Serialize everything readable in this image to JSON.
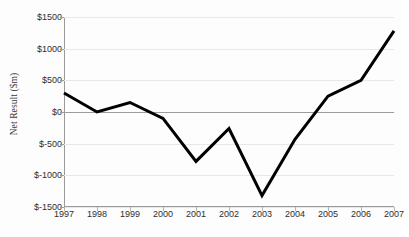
{
  "chart_data": {
    "type": "line",
    "title": "",
    "subtitle": "",
    "xlabel": "",
    "ylabel": "Net Result ($m)",
    "categories": [
      "1997",
      "1998",
      "1999",
      "2000",
      "2001",
      "2002",
      "2003",
      "2004",
      "2005",
      "2006",
      "2007"
    ],
    "values": [
      300,
      0,
      150,
      -100,
      -780,
      -260,
      -1320,
      -430,
      250,
      500,
      1280
    ],
    "series": [
      {
        "name": "Net Result",
        "values": [
          300,
          0,
          150,
          -100,
          -780,
          -260,
          -1320,
          -430,
          250,
          500,
          1280
        ]
      }
    ],
    "ylim": [
      -1500,
      1500
    ],
    "y_ticks": [
      1500,
      1000,
      500,
      0,
      -500,
      -1000,
      -1500
    ],
    "y_tick_labels": [
      "$1500",
      "$1000",
      "$500",
      "$0",
      "$-500",
      "$-1000",
      "$-1500"
    ],
    "x_tick_labels": [
      "1997",
      "1998",
      "1999",
      "2000",
      "2001",
      "2002",
      "2003",
      "2004",
      "2005",
      "2006",
      "2007"
    ],
    "grid": true,
    "grid_axis": "y",
    "legend": false,
    "legend_position": "none",
    "annotations": [],
    "zero_line": true,
    "line_color": "#000000",
    "line_width": 3,
    "grid_color": "#e8e8ea",
    "axis_color": "#9a9a9a",
    "zero_line_color": "#9c9c9c",
    "background_color": "#fdfdfd",
    "text_color": "#2e2e2e"
  }
}
